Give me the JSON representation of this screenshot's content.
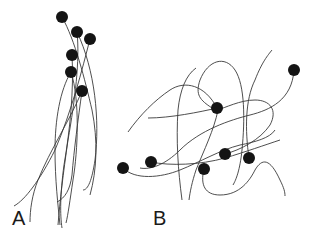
{
  "panels": [
    {
      "label": "A",
      "label_pos": [
        12,
        208
      ],
      "dots": [
        [
          62,
          17
        ],
        [
          77,
          32
        ],
        [
          90,
          39
        ],
        [
          72,
          55
        ],
        [
          71,
          72
        ],
        [
          82,
          91
        ]
      ],
      "curves": [
        "M62,17 C75,40 85,80 92,110 C98,140 97,170 90,195",
        "M77,32 C80,60 75,100 68,140 C63,175 60,200 58,225",
        "M90,39 C82,70 72,110 55,150 C40,180 25,200 14,206",
        "M72,55 C74,90 70,130 64,165 C60,195 60,215 62,228",
        "M71,72 C60,90 55,120 55,150 C55,180 58,205 60,225",
        "M82,91 C78,120 74,150 72,175 C70,190 65,198 57,202",
        "M77,32 C95,70 100,120 95,160 C92,180 88,190 83,190",
        "M82,91 C70,120 50,150 38,180 C32,195 30,210 30,222",
        "M71,72 C80,100 78,150 73,180 C70,200 68,215 66,223"
      ]
    },
    {
      "label": "B",
      "label_pos": [
        153,
        208
      ],
      "dots": [
        [
          294,
          70
        ],
        [
          217,
          108
        ],
        [
          123,
          168
        ],
        [
          151,
          162
        ],
        [
          225,
          154
        ],
        [
          249,
          158
        ],
        [
          204,
          169
        ]
      ],
      "curves": [
        "M294,70 C292,100 270,110 250,115 C230,120 200,130 180,150 C165,165 150,170 140,168",
        "M217,108 C205,85 185,80 170,90 C155,100 140,115 128,132",
        "M217,108 C200,112 170,118 148,118",
        "M123,168 C135,180 160,178 180,170 C200,162 220,150 240,145 C255,142 270,138 275,130",
        "M151,162 C170,166 200,165 225,158 C245,152 265,145 280,140",
        "M225,154 C240,150 260,140 270,125 C278,110 270,100 255,100 C240,100 225,108 217,110",
        "M249,158 C245,130 245,100 255,80 C262,62 268,55 272,50",
        "M204,169 C200,185 205,195 220,195 C240,195 250,180 255,170 C262,158 270,158 280,180 C284,188 285,192 285,196",
        "M212,108 C200,100 195,95 200,80 C208,60 225,55 235,70 C245,85 245,120 242,150 C240,170 236,180 233,185",
        "M218,110 C214,130 204,150 196,170 C192,182 190,192 189,200",
        "M182,200 C178,170 176,140 178,110 C180,90 186,75 196,68"
      ]
    }
  ],
  "colors": {
    "stroke": "#3a3a3a",
    "dot": "#141414"
  }
}
